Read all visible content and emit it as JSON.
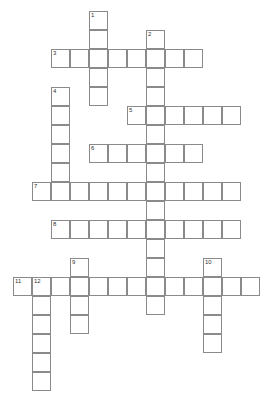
{
  "puzzle": {
    "type": "crossword",
    "cell_size": 19,
    "origin_x": 13,
    "origin_y": 11,
    "border_color": "#8a8a8a",
    "entries": [
      {
        "number": "1",
        "direction": "down",
        "row": 0,
        "col": 4,
        "length": 5
      },
      {
        "number": "2",
        "direction": "down",
        "row": 1,
        "col": 7,
        "length": 15
      },
      {
        "number": "3",
        "direction": "across",
        "row": 2,
        "col": 2,
        "length": 8
      },
      {
        "number": "4",
        "direction": "down",
        "row": 4,
        "col": 2,
        "length": 6
      },
      {
        "number": "5",
        "direction": "across",
        "row": 5,
        "col": 6,
        "length": 6
      },
      {
        "number": "6",
        "direction": "across",
        "row": 7,
        "col": 4,
        "length": 6
      },
      {
        "number": "7",
        "direction": "across",
        "row": 9,
        "col": 1,
        "length": 11
      },
      {
        "number": "8",
        "direction": "across",
        "row": 11,
        "col": 2,
        "length": 10
      },
      {
        "number": "9",
        "direction": "down",
        "row": 13,
        "col": 3,
        "length": 4
      },
      {
        "number": "10",
        "direction": "down",
        "row": 13,
        "col": 10,
        "length": 5
      },
      {
        "number": "11",
        "direction": "across",
        "row": 14,
        "col": 0,
        "length": 13
      },
      {
        "number": "12",
        "direction": "down",
        "row": 14,
        "col": 1,
        "length": 6
      }
    ]
  }
}
